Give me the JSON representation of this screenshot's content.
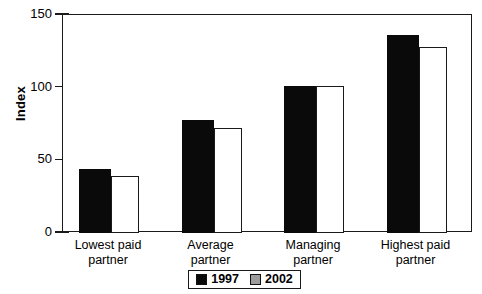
{
  "chart_data": {
    "type": "bar",
    "title": "",
    "xlabel": "",
    "ylabel": "Index",
    "ylim": [
      0,
      150
    ],
    "yticks": [
      0,
      50,
      100,
      150
    ],
    "ytick_labels": [
      "0",
      "50",
      "100",
      "150"
    ],
    "grid": false,
    "legend_position": "bottom",
    "categories": [
      "Lowest paid\npartner",
      "Average\npartner",
      "Managing\npartner",
      "Highest paid\npartner"
    ],
    "series": [
      {
        "name": "1997",
        "color": "#0a0a0a",
        "values": [
          44,
          78,
          101,
          136
        ]
      },
      {
        "name": "2002",
        "color": "#ffffff",
        "values": [
          39,
          72,
          101,
          128
        ]
      }
    ]
  },
  "legend": {
    "items": [
      {
        "label": "1997",
        "swatch": "black-square-swatch"
      },
      {
        "label": "2002",
        "swatch": "gray-square-swatch"
      }
    ]
  },
  "axis": {
    "y_title": "Index"
  }
}
